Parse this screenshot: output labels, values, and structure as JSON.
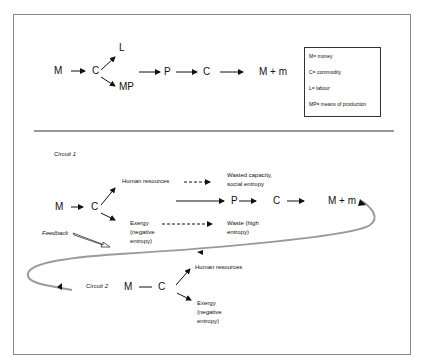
{
  "circuit_top": {
    "nodes": {
      "M": "M",
      "C": "C",
      "L": "L",
      "MP": "MP",
      "P": "P",
      "C2": "C",
      "result": "M + m"
    },
    "legend": [
      "M= money",
      "C= commodity",
      "L= labour",
      "MP= means of production"
    ]
  },
  "circuit1": {
    "label": "Circuit 1",
    "M": "M",
    "C": "C",
    "human_resources": "Human resources",
    "wasted_line1": "Wasted capacity,",
    "wasted_line2": "social entropy",
    "exergy_line1": "Exergy",
    "exergy_line2": "(negative",
    "exergy_line3": "entropy)",
    "waste_line1": "Waste (high",
    "waste_line2": "entropy)",
    "P": "P",
    "C2": "C",
    "result": "M + m"
  },
  "feedback": {
    "label": "Feedback"
  },
  "circuit2": {
    "label": "Circuit 2",
    "M": "M",
    "C": "C",
    "human_resources": "Human resources",
    "exergy_line1": "Exergy",
    "exergy_line2": "(negative",
    "exergy_line3": "entropy)"
  },
  "colors": {
    "border": "#8a8a8a",
    "feedback_curve": "#9a9a9a",
    "text": "#111111"
  }
}
